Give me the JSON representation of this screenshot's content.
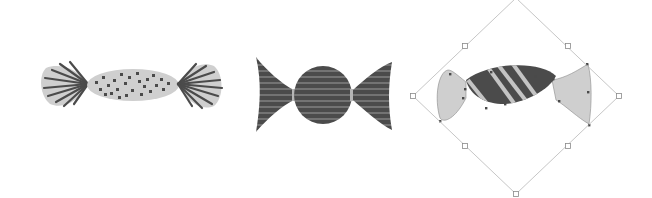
{
  "canvas": {
    "width": 652,
    "height": 198,
    "background": "#ffffff"
  },
  "colors": {
    "light_fill": "#cfcfcf",
    "dark_fill": "#4b4b4b",
    "stripe": "#c4c4c4",
    "dots": "#4a4a4a",
    "selection_line": "#b8b8b8",
    "handle_stroke": "#8a8a8a"
  },
  "objects": [
    {
      "name": "candy-dotted",
      "description": "Light gray wrapped candy with dark dots and dark pleated wrapper ends"
    },
    {
      "name": "candy-striped-horizontal",
      "description": "Dark candy with horizontal light stripes, round center and fin-shaped ends"
    },
    {
      "name": "candy-striped-diagonal-selected",
      "description": "Candy with diagonal stripes, selected with rotated bounding box and handles"
    }
  ],
  "selection": {
    "rotation_deg": 45,
    "handles": [
      {
        "id": "top-left",
        "x": 465,
        "y": 46
      },
      {
        "id": "top-right",
        "x": 568,
        "y": 46
      },
      {
        "id": "left",
        "x": 413,
        "y": 96
      },
      {
        "id": "right",
        "x": 619,
        "y": 96
      },
      {
        "id": "bottom-left",
        "x": 465,
        "y": 146
      },
      {
        "id": "bottom-right",
        "x": 568,
        "y": 146
      },
      {
        "id": "bottom",
        "x": 516,
        "y": 194
      }
    ]
  }
}
